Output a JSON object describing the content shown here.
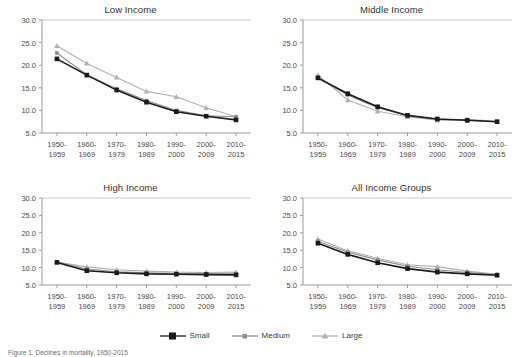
{
  "figure": {
    "caption": "Figure 1. Declines in mortality, 1950-2015",
    "legend": [
      {
        "label": "Small",
        "marker": "filled-square",
        "color": "#1a1a1a"
      },
      {
        "label": "Medium",
        "marker": "filled-square-small",
        "color": "#8c8c8c"
      },
      {
        "label": "Large",
        "marker": "filled-triangle",
        "color": "#b0b0b0"
      }
    ]
  },
  "chart_data": [
    {
      "type": "line",
      "title": "Low Income",
      "xlabel": "",
      "ylabel": "",
      "ylim": [
        5.0,
        30.0
      ],
      "yticks": [
        5.0,
        10.0,
        15.0,
        20.0,
        25.0,
        30.0
      ],
      "ytick_labels": [
        "5.0",
        "10.0",
        "15.0",
        "20.0",
        "25.0",
        "30.0"
      ],
      "grid": false,
      "legend_position": "bottom-figure",
      "categories": [
        "1950-\n1959",
        "1960-\n1969",
        "1970-\n1979",
        "1980-\n1989",
        "1990-\n2000",
        "2000-\n2009",
        "2010-\n2015"
      ],
      "series": [
        {
          "name": "Small",
          "color": "#1a1a1a",
          "marker": "square",
          "values": [
            21.4,
            17.8,
            14.5,
            11.8,
            9.7,
            8.7,
            7.9
          ]
        },
        {
          "name": "Medium",
          "color": "#8c8c8c",
          "marker": "square",
          "values": [
            22.7,
            17.9,
            14.8,
            12.2,
            10.0,
            8.8,
            8.6
          ]
        },
        {
          "name": "Large",
          "color": "#b0b0b0",
          "marker": "triangle",
          "values": [
            24.3,
            20.4,
            17.3,
            14.2,
            13.0,
            10.6,
            8.6
          ]
        }
      ]
    },
    {
      "type": "line",
      "title": "Middle Income",
      "xlabel": "",
      "ylabel": "",
      "ylim": [
        5.0,
        30.0
      ],
      "yticks": [
        5.0,
        10.0,
        15.0,
        20.0,
        25.0,
        30.0
      ],
      "ytick_labels": [
        "5.0",
        "10.0",
        "15.0",
        "20.0",
        "25.0",
        "30.0"
      ],
      "grid": false,
      "legend_position": "bottom-figure",
      "categories": [
        "1950-\n1959",
        "1960-\n1969",
        "1970-\n1979",
        "1980-\n1989",
        "1990-\n2000",
        "2000-\n2009",
        "2010-\n2015"
      ],
      "series": [
        {
          "name": "Small",
          "color": "#1a1a1a",
          "marker": "square",
          "values": [
            17.2,
            13.7,
            10.8,
            8.9,
            8.1,
            7.8,
            7.5
          ]
        },
        {
          "name": "Medium",
          "color": "#8c8c8c",
          "marker": "square",
          "values": [
            17.1,
            13.4,
            10.6,
            8.8,
            8.0,
            7.8,
            7.5
          ]
        },
        {
          "name": "Large",
          "color": "#b0b0b0",
          "marker": "triangle",
          "values": [
            17.8,
            12.3,
            9.8,
            8.6,
            7.8,
            8.0,
            7.6
          ]
        }
      ]
    },
    {
      "type": "line",
      "title": "High Income",
      "xlabel": "",
      "ylabel": "",
      "ylim": [
        5.0,
        30.0
      ],
      "yticks": [
        5.0,
        10.0,
        15.0,
        20.0,
        25.0,
        30.0
      ],
      "ytick_labels": [
        "5.0",
        "10.0",
        "15.0",
        "20.0",
        "25.0",
        "30.0"
      ],
      "grid": false,
      "legend_position": "bottom-figure",
      "categories": [
        "1950-\n1959",
        "1960-\n1969",
        "1970-\n1979",
        "1980-\n1989",
        "1990-\n2000",
        "2000-\n2009",
        "2010-\n2015"
      ],
      "series": [
        {
          "name": "Small",
          "color": "#1a1a1a",
          "marker": "square",
          "values": [
            11.5,
            9.1,
            8.5,
            8.2,
            8.1,
            8.0,
            7.9
          ]
        },
        {
          "name": "Medium",
          "color": "#8c8c8c",
          "marker": "square",
          "values": [
            11.6,
            9.6,
            8.8,
            8.5,
            8.3,
            8.2,
            8.2
          ]
        },
        {
          "name": "Large",
          "color": "#b0b0b0",
          "marker": "triangle",
          "values": [
            11.6,
            10.2,
            9.4,
            9.0,
            8.7,
            8.6,
            8.7
          ]
        }
      ]
    },
    {
      "type": "line",
      "title": "All Income Groups",
      "xlabel": "",
      "ylabel": "",
      "ylim": [
        5.0,
        30.0
      ],
      "yticks": [
        5.0,
        10.0,
        15.0,
        20.0,
        25.0,
        30.0
      ],
      "ytick_labels": [
        "5.0",
        "10.0",
        "15.0",
        "20.0",
        "25.0",
        "30.0"
      ],
      "grid": false,
      "legend_position": "bottom-figure",
      "categories": [
        "1950-\n1959",
        "1960-\n1969",
        "1970-\n1979",
        "1980-\n1989",
        "1990-\n2000",
        "2000-\n2009",
        "2010-\n2015"
      ],
      "series": [
        {
          "name": "Small",
          "color": "#1a1a1a",
          "marker": "square",
          "values": [
            17.0,
            13.8,
            11.4,
            9.7,
            8.7,
            8.2,
            7.8
          ]
        },
        {
          "name": "Medium",
          "color": "#8c8c8c",
          "marker": "square",
          "values": [
            17.6,
            14.4,
            12.2,
            10.4,
            9.4,
            8.6,
            8.0
          ]
        },
        {
          "name": "Large",
          "color": "#b0b0b0",
          "marker": "triangle",
          "values": [
            18.2,
            14.8,
            12.7,
            10.8,
            10.3,
            9.0,
            8.1
          ]
        }
      ]
    }
  ]
}
